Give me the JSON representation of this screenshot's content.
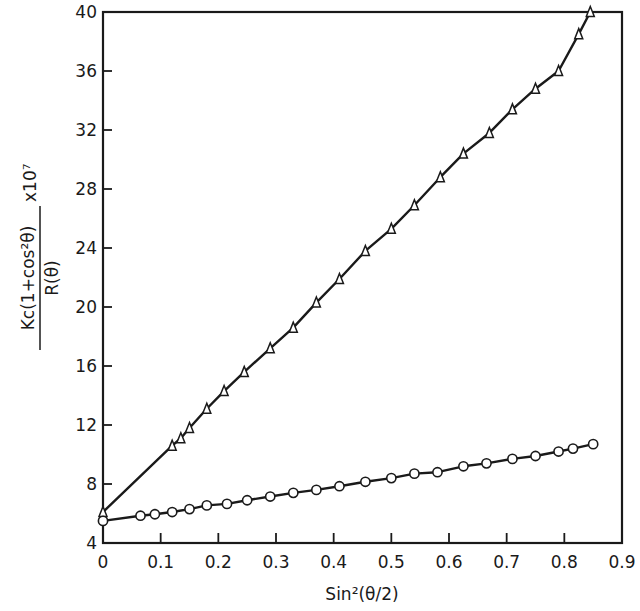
{
  "chart_data": {
    "type": "line",
    "title": "",
    "xlabel": "Sin²(θ/2)",
    "ylabel": "Kc(1+cos²θ) / R(θ) x10⁷",
    "ylabel_parts": {
      "numerator": "Kc(1+cos²θ)",
      "denominator": "R(θ)",
      "multiplier": "x10⁷"
    },
    "xlim": [
      0,
      0.9
    ],
    "ylim": [
      4,
      40
    ],
    "x_ticks": [
      "0",
      "0.1",
      "0.2",
      "0.3",
      "0.4",
      "0.5",
      "0.6",
      "0.7",
      "0.8",
      "0.9"
    ],
    "y_ticks": [
      "4",
      "8",
      "12",
      "16",
      "20",
      "24",
      "28",
      "32",
      "36",
      "40"
    ],
    "grid": false,
    "legend": null,
    "series": [
      {
        "name": "triangles",
        "marker": "triangle-open",
        "x": [
          0,
          0.12,
          0.135,
          0.15,
          0.18,
          0.21,
          0.245,
          0.29,
          0.33,
          0.37,
          0.41,
          0.455,
          0.5,
          0.54,
          0.585,
          0.625,
          0.67,
          0.71,
          0.75,
          0.79,
          0.825,
          0.845
        ],
        "values": [
          6.1,
          10.6,
          11.1,
          11.8,
          13.1,
          14.3,
          15.6,
          17.2,
          18.6,
          20.3,
          21.9,
          23.8,
          25.3,
          26.9,
          28.8,
          30.4,
          31.8,
          33.4,
          34.8,
          36.0,
          38.5,
          40.0
        ]
      },
      {
        "name": "circles",
        "marker": "circle-open",
        "x": [
          0,
          0.065,
          0.09,
          0.12,
          0.15,
          0.18,
          0.215,
          0.25,
          0.29,
          0.33,
          0.37,
          0.41,
          0.455,
          0.5,
          0.54,
          0.58,
          0.625,
          0.665,
          0.71,
          0.75,
          0.79,
          0.815,
          0.85
        ],
        "values": [
          5.5,
          5.85,
          5.95,
          6.1,
          6.3,
          6.55,
          6.65,
          6.9,
          7.15,
          7.4,
          7.6,
          7.85,
          8.15,
          8.4,
          8.7,
          8.8,
          9.2,
          9.4,
          9.7,
          9.9,
          10.2,
          10.4,
          10.7
        ]
      }
    ]
  }
}
